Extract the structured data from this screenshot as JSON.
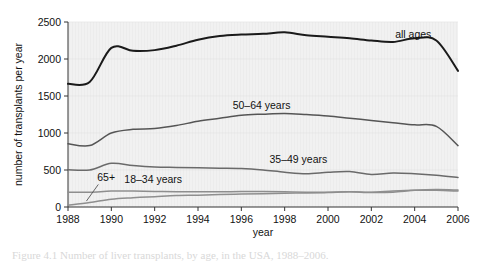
{
  "figure": {
    "caption": "Figure 4.1  Number of liver transplants, by age, in the USA, 1988–2006."
  },
  "chart_data": {
    "type": "line",
    "title": "",
    "xlabel": "year",
    "ylabel": "number of transplants per year",
    "xlim": [
      1988,
      2006
    ],
    "ylim": [
      0,
      2500
    ],
    "xticks": [
      1988,
      1990,
      1992,
      1994,
      1996,
      1998,
      2000,
      2002,
      2004,
      2006
    ],
    "yticks": [
      0,
      500,
      1000,
      1500,
      2000,
      2500
    ],
    "xtick_labels": [
      "1988",
      "1990",
      "1992",
      "1994",
      "1996",
      "1998",
      "2000",
      "2002",
      "2004",
      "2006"
    ],
    "ytick_labels": [
      "0",
      "500",
      "1000",
      "1500",
      "2000",
      "2500"
    ],
    "grid": false,
    "legend_position": "inline-annotations",
    "x": [
      1988,
      1989,
      1990,
      1991,
      1992,
      1993,
      1994,
      1995,
      1996,
      1997,
      1998,
      1999,
      2000,
      2001,
      2002,
      2003,
      2004,
      2005,
      2006
    ],
    "series": [
      {
        "name": "all ages",
        "label": "all ages",
        "color": "#1a1a1a",
        "width": 2.0,
        "label_x": 2003.1,
        "label_y": 2290,
        "values": [
          1665,
          1690,
          2150,
          2110,
          2120,
          2180,
          2260,
          2310,
          2330,
          2340,
          2360,
          2320,
          2300,
          2280,
          2250,
          2230,
          2280,
          2250,
          1840
        ]
      },
      {
        "name": "50-64 years",
        "label": "50–64 years",
        "color": "#555555",
        "width": 1.5,
        "label_x": 1995.6,
        "label_y": 1330,
        "values": [
          855,
          830,
          1000,
          1050,
          1060,
          1100,
          1160,
          1200,
          1240,
          1255,
          1265,
          1250,
          1230,
          1200,
          1170,
          1140,
          1110,
          1090,
          830
        ]
      },
      {
        "name": "35-49 years",
        "label": "35–49 years",
        "color": "#6a6a6a",
        "width": 1.5,
        "label_x": 1997.3,
        "label_y": 600,
        "values": [
          505,
          500,
          590,
          560,
          540,
          535,
          530,
          525,
          520,
          500,
          470,
          450,
          470,
          480,
          440,
          460,
          450,
          430,
          400
        ]
      },
      {
        "name": "18-34 years",
        "label": "18–34 years",
        "color": "#8e8e8e",
        "width": 1.5,
        "label_x": 1990.6,
        "label_y": 330,
        "values": [
          200,
          200,
          215,
          215,
          210,
          205,
          205,
          205,
          210,
          210,
          205,
          200,
          200,
          205,
          195,
          200,
          225,
          235,
          230
        ]
      },
      {
        "name": "65+",
        "label": "65+",
        "color": "#8e8e8e",
        "width": 1.5,
        "label_x": 1989.35,
        "label_y": 345,
        "leader": {
          "x1": 1989.4,
          "y1": 305,
          "x2": 1988.85,
          "y2": 80
        },
        "values": [
          25,
          60,
          105,
          125,
          140,
          155,
          160,
          170,
          175,
          180,
          185,
          190,
          195,
          205,
          200,
          215,
          225,
          225,
          215
        ]
      }
    ]
  }
}
